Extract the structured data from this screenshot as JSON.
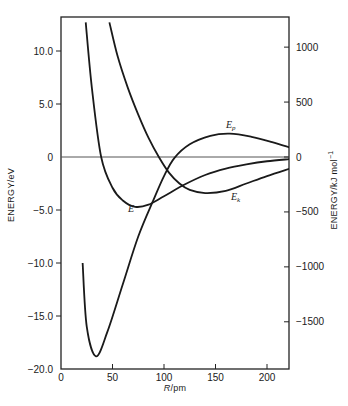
{
  "chart_data": {
    "type": "line",
    "title": "",
    "xlabel": "R/pm",
    "ylabel": "ENERGY/eV",
    "ylabel_right": "ENERGY/kJ mol⁻¹",
    "xlim": [
      0,
      222
    ],
    "ylim": [
      -20.0,
      12.7
    ],
    "ylim_right": [
      -1930,
      1225
    ],
    "x_ticks": [
      "0",
      "50",
      "100",
      "150",
      "200"
    ],
    "y_ticks_left": [
      "10.0",
      "5.0",
      "0",
      "-5.0",
      "-10.0",
      "-15.0",
      "-20.0"
    ],
    "y_ticks_right": [
      "1000",
      "500",
      "0",
      "-500",
      "-1000",
      "-1500"
    ],
    "grid": false,
    "zero_line": true,
    "series": [
      {
        "name": "E",
        "label": "E",
        "x": [
          24,
          30,
          39,
          50,
          60,
          72,
          85,
          100,
          120,
          140,
          160,
          180,
          200,
          222
        ],
        "y": [
          12.7,
          6.5,
          0.0,
          -2.9,
          -4.1,
          -4.7,
          -4.5,
          -3.7,
          -2.6,
          -1.7,
          -1.1,
          -0.7,
          -0.4,
          -0.2
        ]
      },
      {
        "name": "Ep",
        "label": "E_p",
        "x": [
          21,
          25,
          34,
          45,
          60,
          75,
          90,
          100,
          110,
          125,
          145,
          164,
          185,
          205,
          222
        ],
        "y": [
          -10.0,
          -16.0,
          -18.8,
          -16.5,
          -12.0,
          -7.5,
          -4.0,
          -1.8,
          -0.1,
          1.2,
          2.0,
          2.2,
          1.9,
          1.4,
          0.9
        ]
      },
      {
        "name": "Ek",
        "label": "E_k",
        "x": [
          47,
          55,
          65,
          75,
          85,
          95,
          105,
          115,
          125,
          140,
          160,
          180,
          200,
          222
        ],
        "y": [
          12.7,
          9.5,
          6.5,
          4.0,
          1.8,
          0.0,
          -1.5,
          -2.5,
          -3.1,
          -3.4,
          -3.2,
          -2.5,
          -1.8,
          -1.1
        ]
      }
    ],
    "annotations": [
      {
        "text": "E",
        "x": 70,
        "y": -5.6
      },
      {
        "text": "E_p",
        "x": 160,
        "y": 2.8
      },
      {
        "text": "E_k",
        "x": 170,
        "y": -4.2
      }
    ]
  },
  "labels": {
    "xlabel_italic": "R",
    "xlabel_unit": "/pm",
    "ylabel_left": "ENERGY/eV",
    "ylabel_right_main": "ENERGY/kJ mol",
    "ylabel_right_sup": "−1",
    "curve_E": "E",
    "curve_Ep_main": "E",
    "curve_Ep_sub": "p",
    "curve_Ek_main": "E",
    "curve_Ek_sub": "k"
  }
}
